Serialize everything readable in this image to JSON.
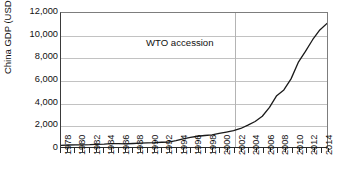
{
  "chart_data": {
    "type": "line",
    "title": "",
    "xlabel": "",
    "ylabel": "China GDP (USD bn)",
    "ylim": [
      0,
      12000
    ],
    "xlim": [
      1978,
      2015
    ],
    "grid": true,
    "legend": false,
    "y_ticks": [
      12000,
      10000,
      8000,
      6000,
      4000,
      2000,
      0
    ],
    "y_tick_labels": [
      "12,000",
      "10,000",
      "8,000",
      "6,000",
      "4,000",
      "2,000",
      "0"
    ],
    "x_tick_labels": [
      "1978",
      "1980",
      "1982",
      "1984",
      "1986",
      "1988",
      "1990",
      "1992",
      "1994",
      "1996",
      "1998",
      "2000",
      "2002",
      "2004",
      "2006",
      "2008",
      "2010",
      "2012",
      "2014"
    ],
    "x_tick_years": [
      1978,
      1980,
      1982,
      1984,
      1986,
      1988,
      1990,
      1992,
      1994,
      1996,
      1998,
      2000,
      2002,
      2004,
      2006,
      2008,
      2010,
      2012,
      2014
    ],
    "x_minor_years": [
      1979,
      1981,
      1983,
      1985,
      1987,
      1989,
      1991,
      1993,
      1995,
      1997,
      1999,
      2001,
      2003,
      2005,
      2007,
      2009,
      2011,
      2013,
      2015
    ],
    "annotations": [
      {
        "text": "WTO accession",
        "year": 2002,
        "value": 8700,
        "vline_year": 2002
      }
    ],
    "series": [
      {
        "name": "China GDP (USD bn)",
        "color": "#1a1a1a",
        "x": [
          1978,
          1979,
          1980,
          1981,
          1982,
          1983,
          1984,
          1985,
          1986,
          1987,
          1988,
          1989,
          1990,
          1991,
          1992,
          1993,
          1994,
          1995,
          1996,
          1997,
          1998,
          1999,
          2000,
          2001,
          2002,
          2003,
          2004,
          2005,
          2006,
          2007,
          2008,
          2009,
          2010,
          2011,
          2012,
          2013,
          2014,
          2015
        ],
        "values": [
          150,
          178,
          191,
          196,
          205,
          230,
          260,
          309,
          300,
          273,
          312,
          348,
          361,
          383,
          427,
          444,
          564,
          735,
          863,
          962,
          1029,
          1094,
          1211,
          1339,
          1471,
          1660,
          1955,
          2286,
          2752,
          3552,
          4598,
          5110,
          6101,
          7573,
          8561,
          9607,
          10482,
          11065
        ]
      }
    ]
  }
}
